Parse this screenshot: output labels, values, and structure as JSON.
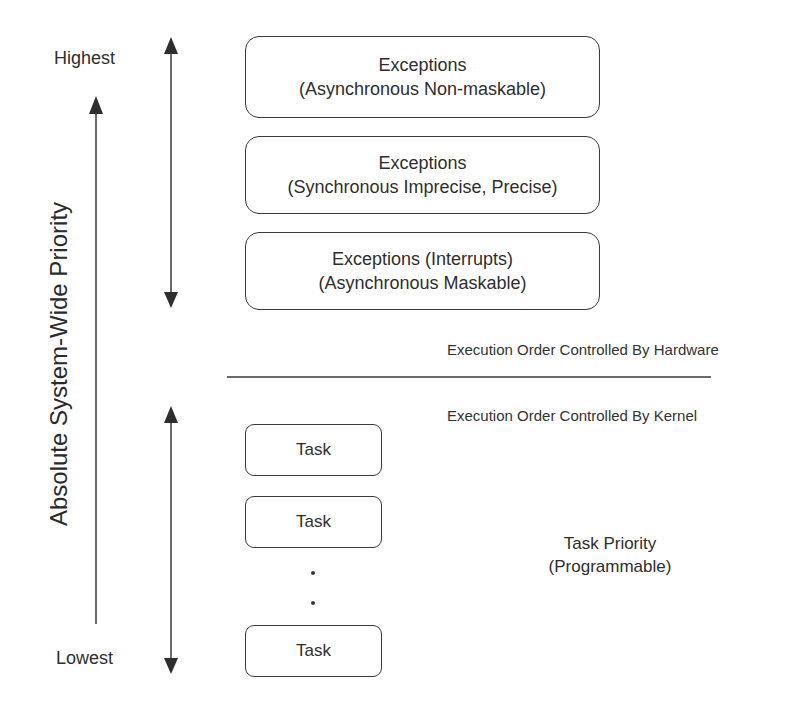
{
  "axis": {
    "title": "Absolute System-Wide Priority",
    "highest_label": "Highest",
    "lowest_label": "Lowest"
  },
  "hardware_section": {
    "boxes": [
      {
        "line1": "Exceptions",
        "line2": "(Asynchronous Non-maskable)"
      },
      {
        "line1": "Exceptions",
        "line2": "(Synchronous Imprecise, Precise)"
      },
      {
        "line1": "Exceptions (Interrupts)",
        "line2": "(Asynchronous Maskable)"
      }
    ],
    "caption": "Execution Order Controlled By Hardware"
  },
  "kernel_section": {
    "caption": "Execution Order Controlled By Kernel",
    "tasks": [
      "Task",
      "Task",
      "Task"
    ],
    "priority_label_line1": "Task Priority",
    "priority_label_line2": "(Programmable)"
  },
  "colors": {
    "stroke": "#3a3a3a",
    "text": "#2e2e2e",
    "background": "#ffffff"
  }
}
